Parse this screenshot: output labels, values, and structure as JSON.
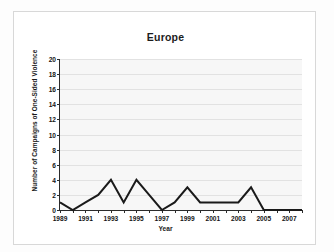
{
  "chart_data": {
    "type": "line",
    "title": "Europe",
    "xlabel": "Year",
    "ylabel": "Number of Campaigns of One-Sided Violence",
    "x": [
      1989,
      1990,
      1991,
      1992,
      1993,
      1994,
      1995,
      1996,
      1997,
      1998,
      1999,
      2000,
      2001,
      2002,
      2003,
      2004,
      2005,
      2006,
      2007,
      2008
    ],
    "values": [
      1,
      0,
      1,
      2,
      4,
      1,
      4,
      2,
      0,
      1,
      3,
      1,
      1,
      1,
      1,
      3,
      0,
      0,
      0,
      0
    ],
    "series": [
      {
        "name": "Campaigns of One-Sided Violence",
        "values": [
          1,
          0,
          1,
          2,
          4,
          1,
          4,
          2,
          0,
          1,
          3,
          1,
          1,
          1,
          1,
          3,
          0,
          0,
          0,
          0
        ]
      }
    ],
    "xlim": [
      1989,
      2008
    ],
    "ylim": [
      0,
      20
    ],
    "ytick_labels": [
      "0",
      "2",
      "4",
      "6",
      "8",
      "10",
      "12",
      "14",
      "16",
      "18",
      "20"
    ],
    "ytick_values": [
      0,
      2,
      4,
      6,
      8,
      10,
      12,
      14,
      16,
      18,
      20
    ],
    "xtick_labels": [
      "1989",
      "1991",
      "1993",
      "1995",
      "1997",
      "1999",
      "2001",
      "2003",
      "2005",
      "2007"
    ],
    "xtick_values": [
      1989,
      1991,
      1993,
      1995,
      1997,
      1999,
      2001,
      2003,
      2005,
      2007
    ],
    "grid": true,
    "legend": false,
    "legend_position": "none",
    "line_color": "#1a1a1a",
    "plot_background": "#f7f7f7",
    "gridline_color": "#e2e2e2",
    "axis_color": "#2b2b2b"
  }
}
